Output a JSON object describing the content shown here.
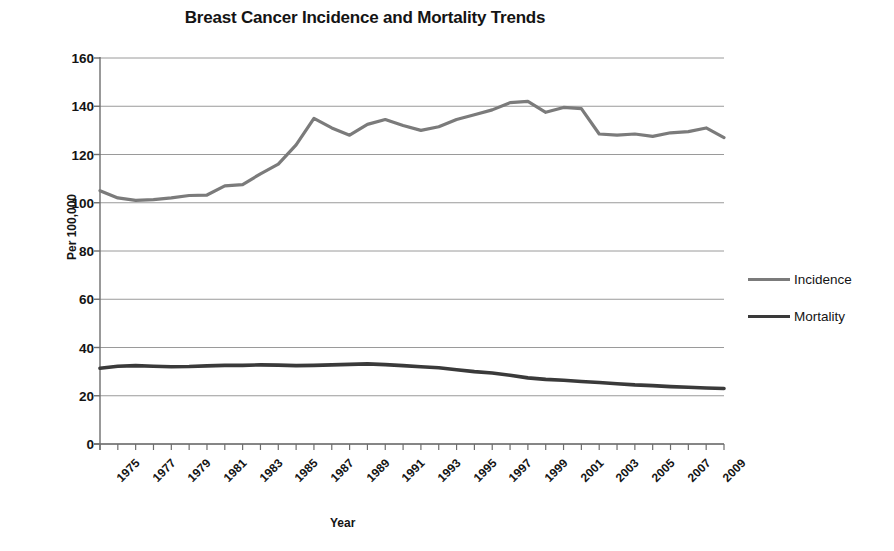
{
  "chart_data": {
    "type": "line",
    "title": "Breast Cancer Incidence and Mortality Trends",
    "xlabel": "Year",
    "ylabel": "Per 100,000",
    "ylim": [
      0,
      160
    ],
    "ytick_step": 20,
    "ytick_labels": [
      "0",
      "20",
      "40",
      "60",
      "80",
      "100",
      "120",
      "140",
      "160"
    ],
    "xlim": [
      1975,
      2010
    ],
    "grid": "horizontal",
    "legend_position": "right",
    "x": [
      1975,
      1976,
      1977,
      1978,
      1979,
      1980,
      1981,
      1982,
      1983,
      1984,
      1985,
      1986,
      1987,
      1988,
      1989,
      1990,
      1991,
      1992,
      1993,
      1994,
      1995,
      1996,
      1997,
      1998,
      1999,
      2000,
      2001,
      2002,
      2003,
      2004,
      2005,
      2006,
      2007,
      2008,
      2009,
      2010
    ],
    "xtick_labels": [
      "1975",
      "1977",
      "1979",
      "1981",
      "1983",
      "1985",
      "1987",
      "1989",
      "1991",
      "1993",
      "1995",
      "1997",
      "1999",
      "2001",
      "2003",
      "2005",
      "2007",
      "2009"
    ],
    "series": [
      {
        "name": "Incidence",
        "color": "#7b7b7b",
        "width": 3.2,
        "values": [
          105.0,
          102.0,
          101.0,
          101.3,
          102.0,
          103.0,
          103.2,
          107.0,
          107.5,
          112.0,
          116.0,
          124.0,
          135.0,
          131.0,
          128.0,
          132.5,
          134.5,
          132.0,
          130.0,
          131.5,
          134.5,
          136.5,
          138.5,
          141.5,
          142.0,
          137.5,
          139.5,
          139.0,
          128.5,
          128.0,
          128.5,
          127.5,
          129.0,
          129.5,
          131.0,
          127.0
        ]
      },
      {
        "name": "Mortality",
        "color": "#3a3a3a",
        "width": 3.6,
        "values": [
          31.4,
          32.2,
          32.5,
          32.2,
          32.0,
          32.1,
          32.4,
          32.6,
          32.6,
          32.8,
          32.7,
          32.5,
          32.6,
          32.8,
          33.0,
          33.2,
          32.9,
          32.5,
          32.0,
          31.6,
          30.8,
          30.0,
          29.4,
          28.5,
          27.4,
          26.8,
          26.4,
          25.9,
          25.5,
          25.0,
          24.5,
          24.2,
          23.8,
          23.5,
          23.2,
          23.0
        ]
      }
    ]
  }
}
